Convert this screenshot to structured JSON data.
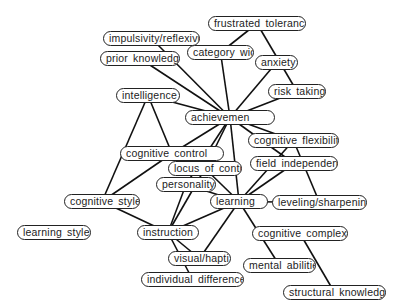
{
  "diagram": {
    "type": "concept-map",
    "nodes": [
      {
        "id": "frustrated_tolerance",
        "label": "frustrated toleranc"
      },
      {
        "id": "impulsivity",
        "label": "impulsivity/reflexivi"
      },
      {
        "id": "category_width",
        "label": "category widt"
      },
      {
        "id": "prior_knowledge",
        "label": "prior knowledge"
      },
      {
        "id": "anxiety",
        "label": "anxiety"
      },
      {
        "id": "risk_taking",
        "label": "risk taking"
      },
      {
        "id": "intelligence",
        "label": "intelligence"
      },
      {
        "id": "achievement",
        "label": "achievemen"
      },
      {
        "id": "cognitive_flexibility",
        "label": "cognitive flexibilit"
      },
      {
        "id": "cognitive_control",
        "label": "cognitive control"
      },
      {
        "id": "locus_of_control",
        "label": "locus of contro"
      },
      {
        "id": "field_independence",
        "label": "field independence"
      },
      {
        "id": "personality",
        "label": "personality"
      },
      {
        "id": "cognitive_styles",
        "label": "cognitive styles"
      },
      {
        "id": "learning",
        "label": "learning"
      },
      {
        "id": "leveling_sharpening",
        "label": "leveling/sharpening"
      },
      {
        "id": "learning_styles",
        "label": "learning styles"
      },
      {
        "id": "instruction",
        "label": "instruction"
      },
      {
        "id": "cognitive_complexity",
        "label": "cognitive complexity"
      },
      {
        "id": "visual_haptic",
        "label": "visual/hapti"
      },
      {
        "id": "mental_abilities",
        "label": "mental abilities"
      },
      {
        "id": "individual_differences",
        "label": "individual differences"
      },
      {
        "id": "structural_knowledge",
        "label": "structural knowledg"
      }
    ],
    "edges": [
      [
        "frustrated_tolerance",
        "category_width"
      ],
      [
        "frustrated_tolerance",
        "risk_taking"
      ],
      [
        "impulsivity",
        "achievement"
      ],
      [
        "category_width",
        "achievement"
      ],
      [
        "prior_knowledge",
        "achievement"
      ],
      [
        "anxiety",
        "achievement"
      ],
      [
        "risk_taking",
        "achievement"
      ],
      [
        "intelligence",
        "achievement"
      ],
      [
        "intelligence",
        "cognitive_control"
      ],
      [
        "intelligence",
        "cognitive_styles"
      ],
      [
        "achievement",
        "cognitive_flexibility"
      ],
      [
        "achievement",
        "field_independence"
      ],
      [
        "achievement",
        "cognitive_control"
      ],
      [
        "achievement",
        "locus_of_control"
      ],
      [
        "achievement",
        "personality"
      ],
      [
        "achievement",
        "learning"
      ],
      [
        "cognitive_flexibility",
        "learning"
      ],
      [
        "cognitive_flexibility",
        "leveling_sharpening"
      ],
      [
        "cognitive_control",
        "cognitive_styles"
      ],
      [
        "field_independence",
        "learning"
      ],
      [
        "locus_of_control",
        "learning"
      ],
      [
        "personality",
        "learning"
      ],
      [
        "personality",
        "instruction"
      ],
      [
        "locus_of_control",
        "instruction"
      ],
      [
        "cognitive_styles",
        "instruction"
      ],
      [
        "learning",
        "leveling_sharpening"
      ],
      [
        "learning",
        "instruction"
      ],
      [
        "learning",
        "visual_haptic"
      ],
      [
        "learning",
        "mental_abilities"
      ],
      [
        "instruction",
        "visual_haptic"
      ],
      [
        "instruction",
        "individual_differences"
      ],
      [
        "cognitive_complexity",
        "structural_knowledge"
      ]
    ]
  }
}
